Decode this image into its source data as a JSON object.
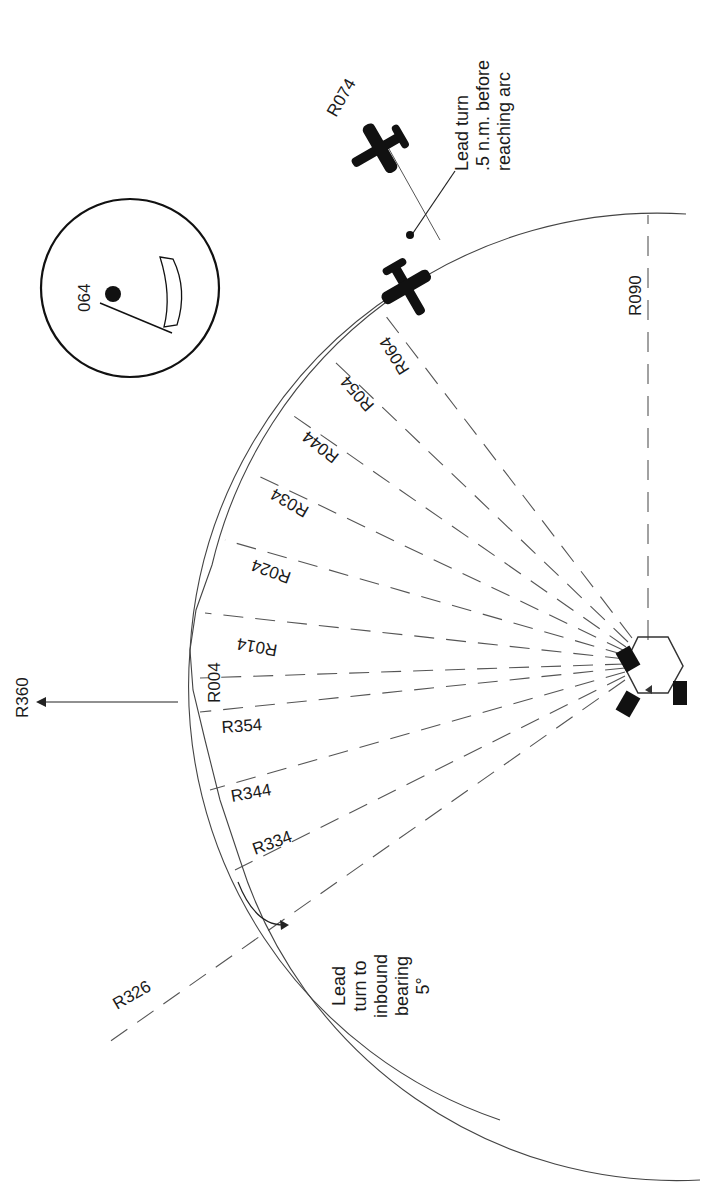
{
  "diagram": {
    "station_center": [
      648,
      665
    ],
    "arc_radius_px": 458,
    "radials": [
      {
        "label": "R326",
        "bearing": 326
      },
      {
        "label": "R334",
        "bearing": 334
      },
      {
        "label": "R344",
        "bearing": 344
      },
      {
        "label": "R354",
        "bearing": 354
      },
      {
        "label": "R004",
        "bearing": 4
      },
      {
        "label": "R014",
        "bearing": 14
      },
      {
        "label": "R024",
        "bearing": 24
      },
      {
        "label": "R034",
        "bearing": 34
      },
      {
        "label": "R044",
        "bearing": 44
      },
      {
        "label": "R054",
        "bearing": 54
      },
      {
        "label": "R064",
        "bearing": 64
      },
      {
        "label": "R074",
        "bearing": 74
      },
      {
        "label": "R090",
        "bearing": 90
      }
    ],
    "north_arrow_label": "R360",
    "notes": {
      "lead_turn_arc": [
        ".5 n.m. before",
        "reaching arc"
      ],
      "lead_turn_arc_first": "Lead turn",
      "lead_turn_inbound": [
        "Lead",
        "turn to",
        "inbound",
        "bearing",
        "5°"
      ]
    },
    "inset": {
      "heading_label": "064",
      "description": "RMI/bearing pointer inset"
    },
    "colors": {
      "ink": "#1a1a1a",
      "dash": "#555555",
      "background": "#ffffff"
    }
  }
}
